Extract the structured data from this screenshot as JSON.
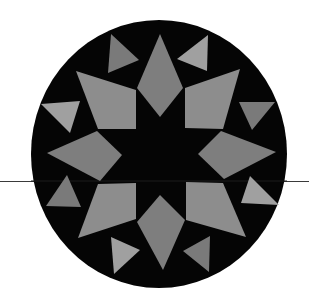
{
  "canvas": {
    "width": 309,
    "height": 297,
    "background": "#ffffff"
  },
  "colors": {
    "disc": "#050505",
    "line": "#3a3a3a",
    "kite": "#7e7e7e",
    "quad": "#8d8d8d",
    "tri_light": "#a0a0a0",
    "tri_dark": "#7a7a7a"
  },
  "disc": {
    "cx": 159,
    "cy": 154,
    "rx": 128,
    "ry": 134
  },
  "horizon_line": {
    "y": 181.5,
    "x1": 0,
    "x2": 309,
    "stroke_width": 1.2
  },
  "kites": [
    {
      "name": "kite-top",
      "points": "160,34 183,88 160,117 137,88"
    },
    {
      "name": "kite-right",
      "points": "198,154 221,131 276,152 224,179"
    },
    {
      "name": "kite-bottom",
      "points": "160,195 185,220 163,270 137,222"
    },
    {
      "name": "kite-left",
      "points": "47,153 97,131 122,155 100,181"
    }
  ],
  "quads": [
    {
      "name": "quad-upper-left",
      "points": "76,71 136,90 136,129 98,129"
    },
    {
      "name": "quad-upper-right",
      "points": "185,88 240,69 223,129 185,128"
    },
    {
      "name": "quad-lower-left",
      "points": "98,184 136,183 136,219 78,238"
    },
    {
      "name": "quad-lower-right",
      "points": "186,182 223,183 246,237 186,220"
    }
  ],
  "triangles": [
    {
      "name": "triangle-top-left",
      "points": "111,34 139,60 108,73",
      "tone": "tri_dark"
    },
    {
      "name": "triangle-top-right",
      "points": "208,35 207,71 177,59",
      "tone": "tri_light"
    },
    {
      "name": "triangle-right-upper",
      "points": "239,102 275,102 252,130",
      "tone": "tri_dark"
    },
    {
      "name": "triangle-right-lower",
      "points": "250,176 279,205 241,203",
      "tone": "tri_light"
    },
    {
      "name": "triangle-bottom-right",
      "points": "210,236 209,272 183,251",
      "tone": "tri_dark"
    },
    {
      "name": "triangle-bottom-left",
      "points": "111,237 140,250 114,274",
      "tone": "tri_light"
    },
    {
      "name": "triangle-left-lower",
      "points": "67,175 46,206 81,207",
      "tone": "tri_dark"
    },
    {
      "name": "triangle-left-upper",
      "points": "41,104 80,101 70,133",
      "tone": "tri_light"
    }
  ]
}
